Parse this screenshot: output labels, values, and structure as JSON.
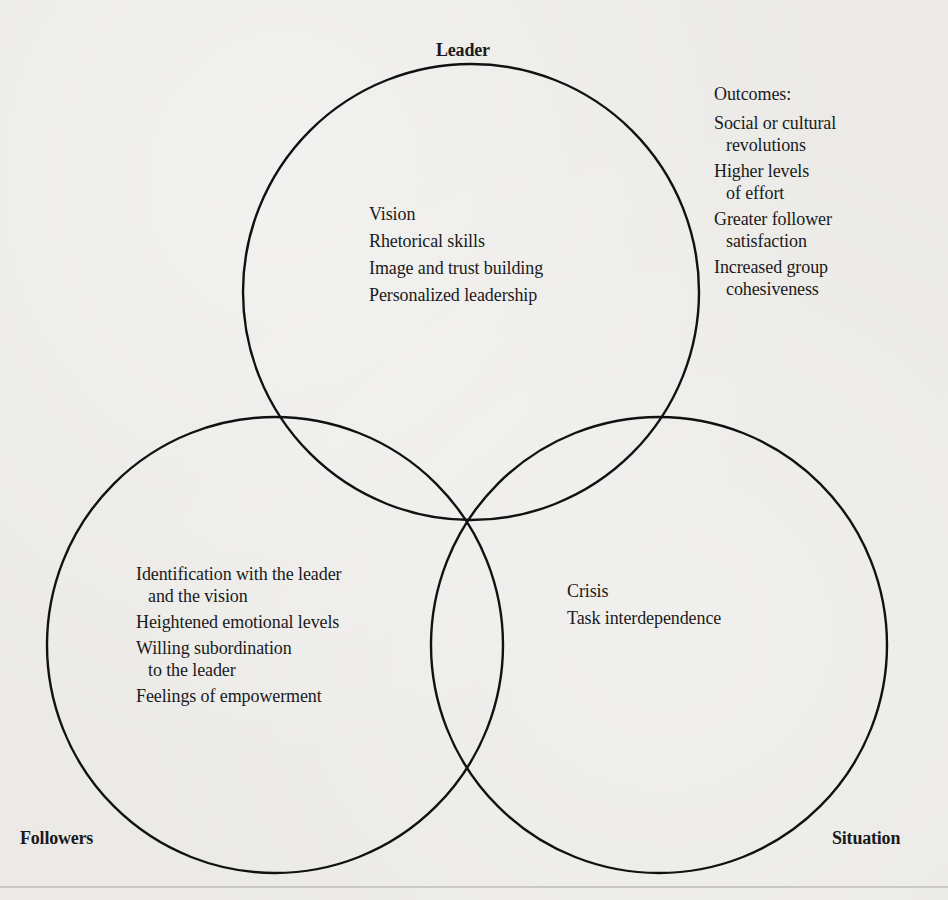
{
  "diagram": {
    "type": "venn",
    "circles": [
      {
        "id": "leader",
        "label": "Leader",
        "cx": 471,
        "cy": 292,
        "r": 228
      },
      {
        "id": "followers",
        "label": "Followers",
        "cx": 275,
        "cy": 645,
        "r": 228
      },
      {
        "id": "situation",
        "label": "Situation",
        "cx": 659,
        "cy": 645,
        "r": 228
      }
    ],
    "stroke_color": "#111111",
    "background_color": "#ebeae7"
  },
  "labels": {
    "leader": "Leader",
    "followers": "Followers",
    "situation": "Situation"
  },
  "leader_factors": [
    "Vision",
    "Rhetorical skills",
    "Image and trust building",
    "Personalized leadership"
  ],
  "outcomes": {
    "heading": "Outcomes:",
    "items": [
      {
        "line1": "Social or cultural",
        "line2": "revolutions"
      },
      {
        "line1": "Higher levels",
        "line2": "of effort"
      },
      {
        "line1": "Greater follower",
        "line2": "satisfaction"
      },
      {
        "line1": "Increased group",
        "line2": "cohesiveness"
      }
    ]
  },
  "follower_factors": [
    {
      "line1": "Identification with the leader",
      "line2": "and the vision"
    },
    {
      "line1": "Heightened emotional levels",
      "line2": null
    },
    {
      "line1": "Willing subordination",
      "line2": "to the leader"
    },
    {
      "line1": "Feelings of empowerment",
      "line2": null
    }
  ],
  "situation_factors": [
    "Crisis",
    "Task interdependence"
  ]
}
